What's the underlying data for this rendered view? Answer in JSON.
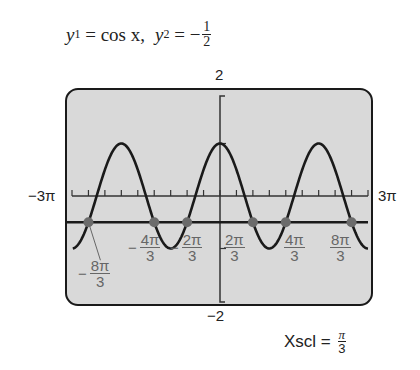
{
  "title": {
    "y1_name": "y",
    "y1_sub": "1",
    "y1_expr": " = cos x,",
    "y2_name": "y",
    "y2_sub": "2",
    "y2_eq": " = −",
    "y2_num": "1",
    "y2_den": "2"
  },
  "axes": {
    "ymax_label": "2",
    "ymin_label": "−2",
    "xmin_label": "−3π",
    "xmax_label": "3π",
    "xscl_label": "Xscl = ",
    "xscl_num": "π",
    "xscl_den": "3"
  },
  "point_labels": [
    {
      "sign": "−",
      "num": "8π",
      "den": "3"
    },
    {
      "sign": "−",
      "num": "4π",
      "den": "3"
    },
    {
      "sign": "−",
      "num": "2π",
      "den": "3"
    },
    {
      "sign": "",
      "num": "2π",
      "den": "3"
    },
    {
      "sign": "",
      "num": "4π",
      "den": "3"
    },
    {
      "sign": "",
      "num": "8π",
      "den": "3"
    }
  ],
  "colors": {
    "screen_bg": "#d9d9d9",
    "curve": "#1a1a1a",
    "point": "#6b6b6b",
    "label": "#666666"
  },
  "chart_data": {
    "type": "line",
    "xlabel": "",
    "ylabel": "",
    "xlim": [
      -9.42478,
      9.42478
    ],
    "ylim": [
      -2,
      2
    ],
    "xscl": "π/3",
    "xlim_labels": [
      "-3π",
      "3π"
    ],
    "ylim_labels": [
      "-2",
      "2"
    ],
    "grid": false,
    "series": [
      {
        "name": "y1 = cos x",
        "function": "cos(x)"
      },
      {
        "name": "y2 = -1/2",
        "function": "-0.5"
      }
    ],
    "intersections": {
      "labels": [
        "-8π/3",
        "-4π/3",
        "-2π/3",
        "2π/3",
        "4π/3",
        "8π/3"
      ],
      "x": [
        -8.37758,
        -4.18879,
        -2.0944,
        2.0944,
        4.18879,
        8.37758
      ],
      "y": [
        -0.5,
        -0.5,
        -0.5,
        -0.5,
        -0.5,
        -0.5
      ]
    }
  }
}
